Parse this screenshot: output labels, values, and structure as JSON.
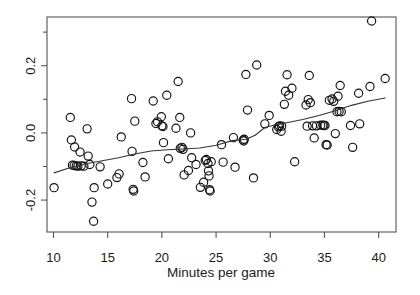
{
  "chart_data": {
    "type": "scatter",
    "title": "",
    "xlabel": "Minutes per game",
    "ylabel": "",
    "xlim": [
      9.4,
      41.6
    ],
    "ylim": [
      -0.295,
      0.345
    ],
    "grid": false,
    "legend": null,
    "xticks": [
      10,
      15,
      20,
      25,
      30,
      35,
      40
    ],
    "xtick_labels": [
      "10",
      "15",
      "20",
      "25",
      "30",
      "35",
      "40"
    ],
    "yticks": [
      -0.2,
      0.0,
      0.2
    ],
    "ytick_labels": [
      "-0.2",
      "0.0",
      "0.2"
    ],
    "marker": "open-circle",
    "marker_size": 4.1,
    "point_color": "#111111",
    "curve_color": "#333333",
    "box_color": "#555555",
    "points": [
      [
        10.05,
        -0.163
      ],
      [
        11.55,
        0.046
      ],
      [
        11.65,
        -0.021
      ],
      [
        11.75,
        -0.096
      ],
      [
        11.9,
        -0.097
      ],
      [
        11.95,
        -0.042
      ],
      [
        12.1,
        -0.098
      ],
      [
        12.25,
        -0.099
      ],
      [
        12.45,
        -0.057
      ],
      [
        12.55,
        -0.098
      ],
      [
        12.8,
        -0.099
      ],
      [
        13.1,
        0.012
      ],
      [
        13.2,
        -0.069
      ],
      [
        13.35,
        -0.094
      ],
      [
        13.55,
        -0.206
      ],
      [
        13.7,
        -0.263
      ],
      [
        13.75,
        -0.163
      ],
      [
        14.3,
        -0.101
      ],
      [
        15.0,
        -0.152
      ],
      [
        15.85,
        -0.133
      ],
      [
        16.05,
        -0.122
      ],
      [
        16.25,
        -0.012
      ],
      [
        17.2,
        0.102
      ],
      [
        17.25,
        -0.055
      ],
      [
        17.35,
        -0.168
      ],
      [
        17.4,
        -0.173
      ],
      [
        17.5,
        0.035
      ],
      [
        18.25,
        -0.088
      ],
      [
        18.45,
        -0.131
      ],
      [
        19.2,
        0.095
      ],
      [
        19.45,
        0.028
      ],
      [
        19.6,
        0.033
      ],
      [
        19.95,
        0.048
      ],
      [
        20.0,
        0.021
      ],
      [
        20.1,
        0.019
      ],
      [
        20.15,
        -0.029
      ],
      [
        20.45,
        0.112
      ],
      [
        20.6,
        -0.077
      ],
      [
        21.3,
        0.014
      ],
      [
        21.5,
        0.153
      ],
      [
        21.65,
        0.046
      ],
      [
        21.7,
        -0.046
      ],
      [
        21.85,
        -0.043
      ],
      [
        21.95,
        -0.049
      ],
      [
        22.05,
        -0.125
      ],
      [
        22.45,
        -0.112
      ],
      [
        22.65,
        0.0
      ],
      [
        22.75,
        -0.074
      ],
      [
        23.15,
        -0.094
      ],
      [
        23.55,
        -0.162
      ],
      [
        23.85,
        -0.147
      ],
      [
        24.0,
        -0.082
      ],
      [
        24.1,
        -0.079
      ],
      [
        24.25,
        -0.091
      ],
      [
        24.3,
        -0.113
      ],
      [
        24.35,
        -0.128
      ],
      [
        24.4,
        -0.169
      ],
      [
        24.45,
        -0.173
      ],
      [
        24.55,
        -0.086
      ],
      [
        25.5,
        -0.035
      ],
      [
        25.65,
        -0.087
      ],
      [
        26.6,
        -0.014
      ],
      [
        26.75,
        -0.102
      ],
      [
        27.5,
        -0.021
      ],
      [
        27.55,
        -0.024
      ],
      [
        27.6,
        -0.019
      ],
      [
        27.75,
        0.174
      ],
      [
        27.9,
        0.068
      ],
      [
        28.45,
        -0.134
      ],
      [
        28.75,
        0.202
      ],
      [
        29.5,
        0.027
      ],
      [
        29.9,
        0.052
      ],
      [
        30.6,
        0.01
      ],
      [
        30.75,
        0.018
      ],
      [
        30.85,
        0.021
      ],
      [
        31.0,
        0.005
      ],
      [
        31.05,
        0.02
      ],
      [
        31.3,
        0.085
      ],
      [
        31.4,
        0.124
      ],
      [
        31.55,
        0.173
      ],
      [
        31.7,
        0.112
      ],
      [
        32.0,
        0.133
      ],
      [
        32.25,
        -0.086
      ],
      [
        33.3,
        0.083
      ],
      [
        33.4,
        0.02
      ],
      [
        33.5,
        0.099
      ],
      [
        33.6,
        0.171
      ],
      [
        33.7,
        0.09
      ],
      [
        33.9,
        0.021
      ],
      [
        34.05,
        -0.015
      ],
      [
        34.25,
        0.021
      ],
      [
        34.65,
        0.023
      ],
      [
        34.85,
        0.023
      ],
      [
        34.95,
        0.022
      ],
      [
        35.05,
        0.022
      ],
      [
        35.15,
        -0.035
      ],
      [
        35.25,
        -0.036
      ],
      [
        35.45,
        0.097
      ],
      [
        35.7,
        0.101
      ],
      [
        35.85,
        0.094
      ],
      [
        36.0,
        -0.002
      ],
      [
        36.15,
        0.063
      ],
      [
        36.25,
        0.109
      ],
      [
        36.35,
        0.064
      ],
      [
        36.45,
        0.141
      ],
      [
        36.55,
        0.063
      ],
      [
        37.4,
        0.022
      ],
      [
        37.6,
        -0.043
      ],
      [
        38.15,
        0.118
      ],
      [
        38.25,
        0.027
      ],
      [
        39.2,
        0.138
      ],
      [
        39.35,
        0.333
      ],
      [
        40.6,
        0.162
      ]
    ],
    "smooth_line": {
      "label": "lowess",
      "points": [
        [
          10.05,
          -0.119
        ],
        [
          11.5,
          -0.104
        ],
        [
          13.0,
          -0.092
        ],
        [
          14.5,
          -0.083
        ],
        [
          16.0,
          -0.074
        ],
        [
          17.5,
          -0.063
        ],
        [
          19.0,
          -0.054
        ],
        [
          20.5,
          -0.05
        ],
        [
          22.0,
          -0.048
        ],
        [
          23.5,
          -0.045
        ],
        [
          25.0,
          -0.037
        ],
        [
          26.5,
          -0.023
        ],
        [
          27.8,
          -0.019
        ],
        [
          28.6,
          -0.007
        ],
        [
          29.5,
          0.016
        ],
        [
          30.5,
          0.024
        ],
        [
          31.5,
          0.03
        ],
        [
          33.0,
          0.04
        ],
        [
          34.5,
          0.052
        ],
        [
          36.0,
          0.066
        ],
        [
          37.5,
          0.082
        ],
        [
          39.0,
          0.094
        ],
        [
          40.6,
          0.104
        ]
      ]
    }
  },
  "axes": {
    "x_axis_name": "x-axis",
    "y_axis_name": "y-axis"
  }
}
